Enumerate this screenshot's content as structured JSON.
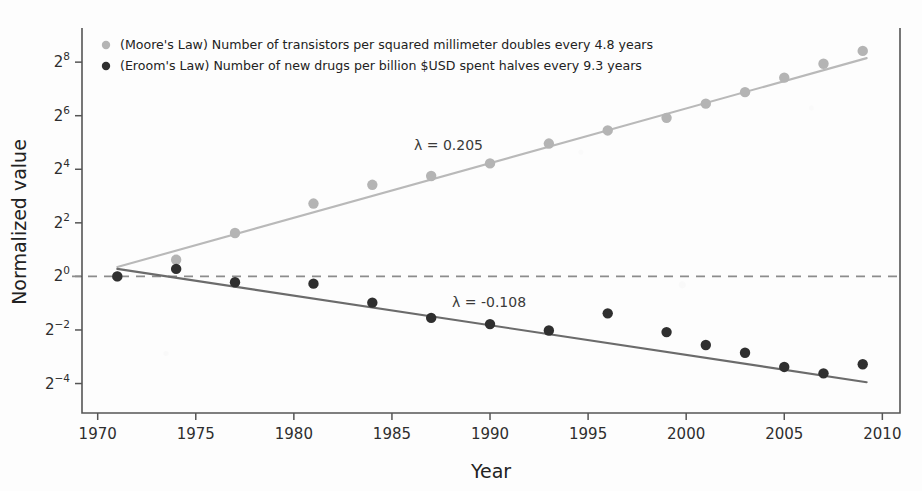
{
  "chart_data": {
    "type": "scatter",
    "title": "",
    "xlabel": "Year",
    "ylabel": "Normalized value",
    "xlim": [
      1969.2,
      2010.9
    ],
    "ylim": [
      -5.1,
      9.2
    ],
    "xticks": [
      "1970",
      "1975",
      "1980",
      "1985",
      "1990",
      "1995",
      "2000",
      "2005",
      "2010"
    ],
    "xtick_values": [
      1970,
      1975,
      1980,
      1985,
      1990,
      1995,
      2000,
      2005,
      2010
    ],
    "yticks": [
      "2^8",
      "2^6",
      "2^4",
      "2^2",
      "2^0",
      "2^-2",
      "2^-4"
    ],
    "ytick_values": [
      8,
      6,
      4,
      2,
      0,
      -2,
      -4
    ],
    "ytick_base": "2",
    "ytick_exponents": [
      "8",
      "6",
      "4",
      "2",
      "0",
      "−2",
      "−4"
    ],
    "yscale": "log2",
    "grid": false,
    "legend_position": "upper left",
    "reference_line": {
      "y": 0,
      "style": "dashed",
      "color": "#8c8c8c"
    },
    "series": [
      {
        "name": "moores-law",
        "label": "(Moore's Law) Number of transistors per squared millimeter doubles every 4.8 years",
        "color": "#b4b4b4",
        "line_color": "#b9b9b9",
        "lambda_label": "λ = 0.205",
        "lambda_value": 0.205,
        "doubling_years": 4.8,
        "fit": {
          "x0": 1971.0,
          "y0": 0.35,
          "x1": 2009.2,
          "y1": 8.15
        },
        "points": [
          {
            "x": 1971,
            "y": 0.0
          },
          {
            "x": 1974,
            "y": 0.62
          },
          {
            "x": 1977,
            "y": 1.62
          },
          {
            "x": 1981,
            "y": 2.72
          },
          {
            "x": 1984,
            "y": 3.42
          },
          {
            "x": 1987,
            "y": 3.75
          },
          {
            "x": 1990,
            "y": 4.22
          },
          {
            "x": 1993,
            "y": 4.96
          },
          {
            "x": 1996,
            "y": 5.45
          },
          {
            "x": 1999,
            "y": 5.92
          },
          {
            "x": 2001,
            "y": 6.45
          },
          {
            "x": 2003,
            "y": 6.88
          },
          {
            "x": 2005,
            "y": 7.42
          },
          {
            "x": 2007,
            "y": 7.94
          },
          {
            "x": 2009,
            "y": 8.42
          }
        ]
      },
      {
        "name": "erooms-law",
        "label": "(Eroom's Law) Number of new drugs per billion $USD spent halves every 9.3 years",
        "color": "#2f2f2f",
        "line_color": "#6b6b6b",
        "lambda_label": "λ = -0.108",
        "lambda_value": -0.108,
        "halving_years": 9.3,
        "fit": {
          "x0": 1971.0,
          "y0": 0.28,
          "x1": 2009.2,
          "y1": -3.95
        },
        "points": [
          {
            "x": 1971,
            "y": 0.0
          },
          {
            "x": 1974,
            "y": 0.28
          },
          {
            "x": 1977,
            "y": -0.22
          },
          {
            "x": 1981,
            "y": -0.27
          },
          {
            "x": 1984,
            "y": -0.98
          },
          {
            "x": 1987,
            "y": -1.55
          },
          {
            "x": 1990,
            "y": -1.78
          },
          {
            "x": 1993,
            "y": -2.02
          },
          {
            "x": 1996,
            "y": -1.38
          },
          {
            "x": 1999,
            "y": -2.08
          },
          {
            "x": 2001,
            "y": -2.56
          },
          {
            "x": 2003,
            "y": -2.85
          },
          {
            "x": 2005,
            "y": -3.38
          },
          {
            "x": 2007,
            "y": -3.62
          },
          {
            "x": 2009,
            "y": -3.28
          }
        ]
      }
    ]
  }
}
